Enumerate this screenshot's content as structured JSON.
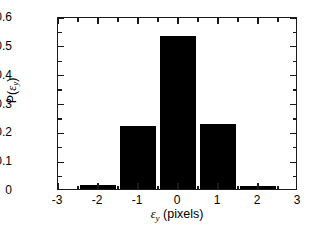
{
  "chart_data": {
    "type": "bar",
    "title": "",
    "xlabel": "ε_y (pixels)",
    "ylabel": "P(ε_y)",
    "categories": [
      -2,
      -1,
      0,
      1,
      2
    ],
    "values": [
      0.013,
      0.218,
      0.53,
      0.227,
      0.01
    ],
    "bar_width": 0.9,
    "xlim": [
      -3,
      3
    ],
    "ylim": [
      0,
      0.6
    ],
    "xticks": [
      -3,
      -2,
      -1,
      0,
      1,
      2,
      3
    ],
    "xtick_labels": [
      "-3",
      "-2",
      "-1",
      "0",
      "1",
      "2",
      "3"
    ],
    "yticks": [
      0,
      0.1,
      0.2,
      0.3,
      0.4,
      0.5,
      0.6
    ],
    "ytick_labels": [
      "0",
      "0.1",
      "0.2",
      "0.3",
      "0.4",
      "0.5",
      "0.6"
    ],
    "x_minor_step": 0.5,
    "y_minor_step": 0.05,
    "grid": false,
    "legend": null,
    "bar_color": "#000000",
    "axis_color": "#1a1a1a",
    "background": "#ffffff"
  },
  "axis_titles": {
    "y_main": "P(",
    "y_var": "ε",
    "y_sub": "y",
    "y_close": ")",
    "x_var": "ε",
    "x_sub": "y",
    "x_units": " (pixels)"
  }
}
